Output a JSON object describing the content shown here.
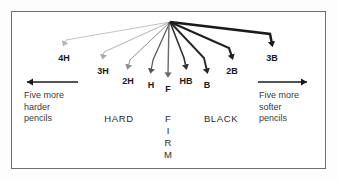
{
  "diagram": {
    "background_color": "#fdfdfd",
    "panel_color": "#ffffff",
    "border_color": "#6e6e70",
    "ink_color": "#1a1a1a"
  },
  "fan": {
    "origin_x": 170,
    "origin_y": 22,
    "description": "Radiating leader lines from a single point to each pencil grade label"
  },
  "grades": [
    {
      "label": "4H",
      "tip_x": 64,
      "tip_y": 48,
      "label_x": 64,
      "label_y": 59,
      "stroke_width": 0.8,
      "stroke_color": "#b4b4b4"
    },
    {
      "label": "3H",
      "tip_x": 103,
      "tip_y": 61,
      "label_x": 103,
      "label_y": 72,
      "stroke_width": 0.9,
      "stroke_color": "#a9a9a9"
    },
    {
      "label": "2H",
      "tip_x": 128,
      "tip_y": 71,
      "label_x": 128,
      "label_y": 82,
      "stroke_width": 1.0,
      "stroke_color": "#8f8f8f"
    },
    {
      "label": "H",
      "tip_x": 151,
      "tip_y": 75,
      "label_x": 151,
      "label_y": 86,
      "stroke_width": 1.2,
      "stroke_color": "#555555"
    },
    {
      "label": "F",
      "tip_x": 168,
      "tip_y": 79,
      "label_x": 168,
      "label_y": 90,
      "stroke_width": 1.4,
      "stroke_color": "#6a6a6a"
    },
    {
      "label": "HB",
      "tip_x": 186,
      "tip_y": 71,
      "label_x": 186,
      "label_y": 82,
      "stroke_width": 1.6,
      "stroke_color": "#333333"
    },
    {
      "label": "B",
      "tip_x": 207,
      "tip_y": 75,
      "label_x": 207,
      "label_y": 86,
      "stroke_width": 1.9,
      "stroke_color": "#262626"
    },
    {
      "label": "2B",
      "tip_x": 232,
      "tip_y": 61,
      "label_x": 232,
      "label_y": 72,
      "stroke_width": 2.2,
      "stroke_color": "#1f1f1f"
    },
    {
      "label": "3B",
      "tip_x": 272,
      "tip_y": 48,
      "label_x": 272,
      "label_y": 59,
      "stroke_width": 2.5,
      "stroke_color": "#1a1a1a"
    }
  ],
  "scale_arrows": {
    "left": {
      "name": "harder-direction-arrow",
      "x_start": 78,
      "x_end": 22,
      "y": 82,
      "direction": "left"
    },
    "right": {
      "name": "softer-direction-arrow",
      "x_start": 258,
      "x_end": 312,
      "y": 82,
      "direction": "right"
    }
  },
  "captions": {
    "left": {
      "line1": "Five more",
      "line2": "harder",
      "line3": "pencils",
      "x": 24,
      "y": 95
    },
    "right": {
      "line1": "Five more",
      "line2": "softer",
      "line3": "pencils",
      "x": 259,
      "y": 95
    }
  },
  "zones": {
    "hard": {
      "label": "HARD",
      "x": 119,
      "y": 116
    },
    "firm": {
      "letters": [
        "F",
        "I",
        "R",
        "M"
      ],
      "x": 168,
      "y": 116
    },
    "black": {
      "label": "BLACK",
      "x": 221,
      "y": 116
    }
  }
}
